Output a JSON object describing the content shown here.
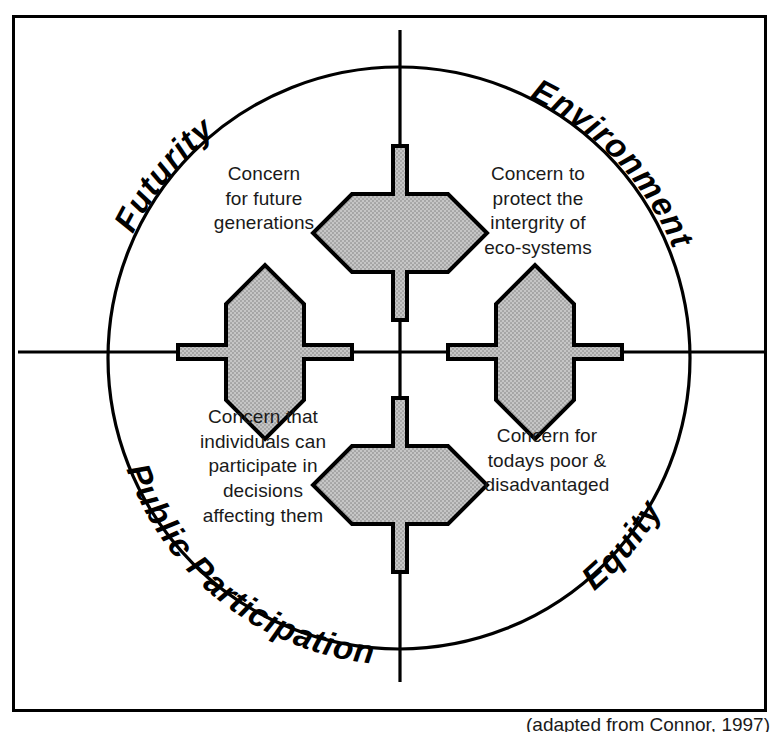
{
  "figure": {
    "caption": "(adapted from Connor, 1997)"
  },
  "colors": {
    "arrow_fill": "#b9b9b9",
    "stroke": "#000000",
    "text": "#1a1a1a",
    "background": "#ffffff"
  },
  "axes": {
    "vertical": {
      "label": "vertical-axis"
    },
    "horizontal": {
      "label": "horizontal-axis"
    }
  },
  "circle": {
    "cx": 399,
    "cy": 358,
    "r": 291
  },
  "curved_labels": [
    {
      "id": "futurity",
      "text": "Futurity",
      "quadrant": "top-left"
    },
    {
      "id": "environment",
      "text": "Environment",
      "quadrant": "top-right"
    },
    {
      "id": "public-participation",
      "text": "Public Participation",
      "quadrant": "bottom-left"
    },
    {
      "id": "equity",
      "text": "Equity",
      "quadrant": "bottom-right"
    }
  ],
  "quadrants": [
    {
      "id": "futurity",
      "label": "Futurity",
      "description": "Concern\nfor future\ngenerations"
    },
    {
      "id": "environment",
      "label": "Environment",
      "description": "Concern to\nprotect the\nintergrity of\neco-systems"
    },
    {
      "id": "public-participation",
      "label": "Public Participation",
      "description": "Concern that\nindividuals can\nparticipate in\ndecisions\naffecting them"
    },
    {
      "id": "equity",
      "label": "Equity",
      "description": "Concern for\ntodays poor &\ndisadvantaged"
    }
  ],
  "arrows": [
    {
      "id": "arrow-top",
      "direction": "vertical",
      "position": "top"
    },
    {
      "id": "arrow-bottom",
      "direction": "vertical",
      "position": "bottom"
    },
    {
      "id": "arrow-left",
      "direction": "horizontal",
      "position": "left"
    },
    {
      "id": "arrow-right",
      "direction": "horizontal",
      "position": "right"
    }
  ]
}
